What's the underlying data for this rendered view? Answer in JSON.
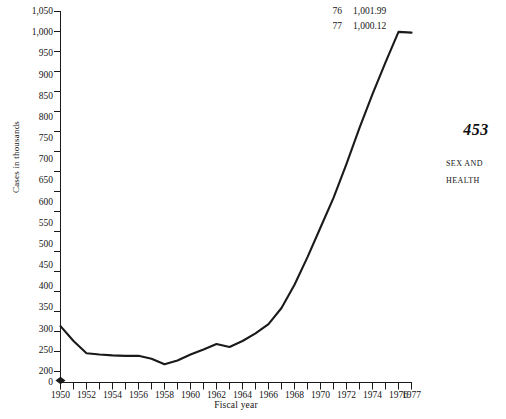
{
  "chart_data": {
    "type": "line",
    "title": "",
    "xlabel": "Fiscal year",
    "ylabel": "Cases in thousands",
    "grid": false,
    "legend": "none",
    "xlim": [
      1950,
      1977
    ],
    "ylim": [
      200,
      1050
    ],
    "y_axis_break": true,
    "y_axis_break_note": "axis broken between 0 and 200",
    "yticks": [
      0,
      200,
      250,
      300,
      350,
      400,
      450,
      500,
      550,
      600,
      650,
      700,
      750,
      800,
      850,
      900,
      950,
      1000,
      1050
    ],
    "ytick_labels": [
      "0",
      "200",
      "250",
      "300",
      "350",
      "400",
      "450",
      "500",
      "550",
      "600",
      "650",
      "700",
      "750",
      "800",
      "850",
      "900",
      "950",
      "1,000",
      "1,050"
    ],
    "xticks": [
      1950,
      1951,
      1952,
      1953,
      1954,
      1955,
      1956,
      1957,
      1958,
      1959,
      1960,
      1961,
      1962,
      1963,
      1964,
      1965,
      1966,
      1967,
      1968,
      1969,
      1970,
      1971,
      1972,
      1973,
      1974,
      1975,
      1976,
      1977
    ],
    "xtick_labels": [
      "1950",
      "1952",
      "1954",
      "1956",
      "1958",
      "1960",
      "1962",
      "1964",
      "1966",
      "1968",
      "1970",
      "1972",
      "1974",
      "1976",
      "1977"
    ],
    "xtick_label_years": [
      1950,
      1952,
      1954,
      1956,
      1958,
      1960,
      1962,
      1964,
      1966,
      1968,
      1970,
      1972,
      1974,
      1976,
      1977
    ],
    "x": [
      1950,
      1951,
      1952,
      1953,
      1954,
      1955,
      1956,
      1957,
      1958,
      1959,
      1960,
      1961,
      1962,
      1963,
      1964,
      1965,
      1966,
      1967,
      1968,
      1969,
      1970,
      1971,
      1972,
      1973,
      1974,
      1975,
      1976,
      1977
    ],
    "values": [
      307,
      272,
      243,
      240,
      238,
      237,
      237,
      230,
      217,
      226,
      240,
      252,
      265,
      258,
      272,
      290,
      312,
      350,
      405,
      470,
      540,
      610,
      690,
      775,
      855,
      930,
      1001.99,
      1000.12
    ],
    "line_color": "#1a1a1a",
    "annotations": [
      {
        "year_label": "76",
        "value_label": "1,001.99"
      },
      {
        "year_label": "77",
        "value_label": "1,000.12"
      }
    ]
  },
  "axis": {
    "y_title": "Cases in thousands",
    "x_title": "Fiscal year"
  },
  "page": {
    "folio": "453",
    "running_head_lines": [
      "SEX AND",
      "HEALTH"
    ]
  }
}
